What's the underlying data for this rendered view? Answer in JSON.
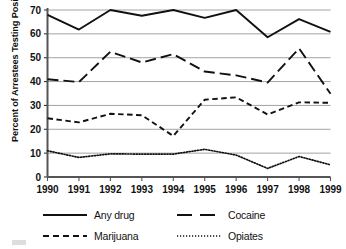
{
  "chart_data": {
    "type": "line",
    "title": "",
    "xlabel": "",
    "ylabel": "Percent of Arrestees Testing Positive",
    "categories": [
      "1990",
      "1991",
      "1992",
      "1993",
      "1994",
      "1995",
      "1996",
      "1997",
      "1998",
      "1999"
    ],
    "x": [
      1990,
      1991,
      1992,
      1993,
      1994,
      1995,
      1996,
      1997,
      1998,
      1999
    ],
    "ylim": [
      0,
      70
    ],
    "xlim": [
      1990,
      1999
    ],
    "yticks": [
      0,
      10,
      20,
      30,
      40,
      50,
      60,
      70
    ],
    "ytick_labels": [
      "0",
      "10",
      "20",
      "30",
      "40",
      "50",
      "60",
      "70"
    ],
    "xtick_labels": [
      "1990",
      "1991",
      "1992",
      "1993",
      "1994",
      "1995",
      "1996",
      "1997",
      "1998",
      "1999"
    ],
    "grid": "horizontal",
    "legend_position": "bottom",
    "series": [
      {
        "name": "Any drug",
        "style": "solid",
        "color": "#111111",
        "values": [
          68.0,
          61.8,
          70.0,
          67.6,
          70.0,
          66.7,
          70.0,
          58.6,
          66.2,
          60.8
        ]
      },
      {
        "name": "Cocaine",
        "style": "long-dash",
        "color": "#111111",
        "values": [
          41.0,
          39.8,
          52.5,
          48.0,
          51.5,
          44.2,
          42.6,
          39.6,
          53.9,
          34.9
        ]
      },
      {
        "name": "Marijuana",
        "style": "short-dash",
        "color": "#111111",
        "values": [
          24.6,
          22.9,
          26.5,
          25.9,
          17.2,
          32.4,
          33.4,
          26.2,
          31.3,
          31.1
        ]
      },
      {
        "name": "Opiates",
        "style": "dotted",
        "color": "#111111",
        "values": [
          11.0,
          8.2,
          9.7,
          9.6,
          9.6,
          11.6,
          9.2,
          3.6,
          8.6,
          5.1
        ]
      }
    ]
  },
  "legend": {
    "entries": [
      {
        "label": "Any drug",
        "style": "solid"
      },
      {
        "label": "Cocaine",
        "style": "long-dash"
      },
      {
        "label": "Marijuana",
        "style": "short-dash"
      },
      {
        "label": "Opiates",
        "style": "dotted"
      }
    ]
  }
}
